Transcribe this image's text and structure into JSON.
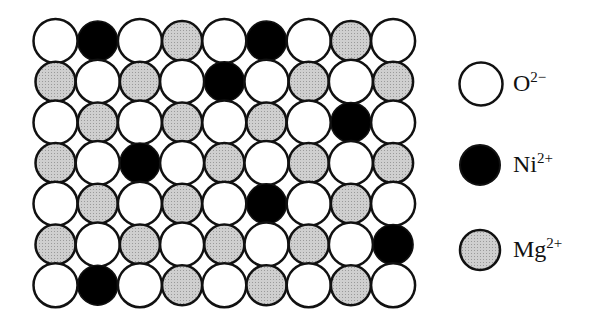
{
  "diagram": {
    "type": "ionic solid solution lattice",
    "rows": 7,
    "cols": 9,
    "grid": [
      [
        "O",
        "Ni",
        "O",
        "Mg",
        "O",
        "Ni",
        "O",
        "Mg",
        "O"
      ],
      [
        "Mg",
        "O",
        "Mg",
        "O",
        "Ni",
        "O",
        "Mg",
        "O",
        "Mg"
      ],
      [
        "O",
        "Mg",
        "O",
        "Mg",
        "O",
        "Mg",
        "O",
        "Ni",
        "O"
      ],
      [
        "Mg",
        "O",
        "Ni",
        "O",
        "Mg",
        "O",
        "Mg",
        "O",
        "Mg"
      ],
      [
        "O",
        "Mg",
        "O",
        "Mg",
        "O",
        "Ni",
        "O",
        "Mg",
        "O"
      ],
      [
        "Mg",
        "O",
        "Mg",
        "O",
        "Mg",
        "O",
        "Mg",
        "O",
        "Ni"
      ],
      [
        "O",
        "Ni",
        "O",
        "Mg",
        "O",
        "Mg",
        "O",
        "Mg",
        "O"
      ]
    ]
  },
  "species": {
    "O": {
      "symbol": "O",
      "charge": "2−",
      "fill": "#ffffff",
      "radius": 22
    },
    "Ni": {
      "symbol": "Ni",
      "charge": "2+",
      "fill": "#000000",
      "radius": 20
    },
    "Mg": {
      "symbol": "Mg",
      "charge": "2+",
      "fill": "#c4c4c4",
      "radius": 20
    }
  },
  "legend": [
    {
      "key": "O",
      "symbol": "O",
      "charge": "2−"
    },
    {
      "key": "Ni",
      "symbol": "Ni",
      "charge": "2+"
    },
    {
      "key": "Mg",
      "symbol": "Mg",
      "charge": "2+"
    }
  ],
  "colors": {
    "outline": "#111111",
    "background": "#ffffff"
  }
}
